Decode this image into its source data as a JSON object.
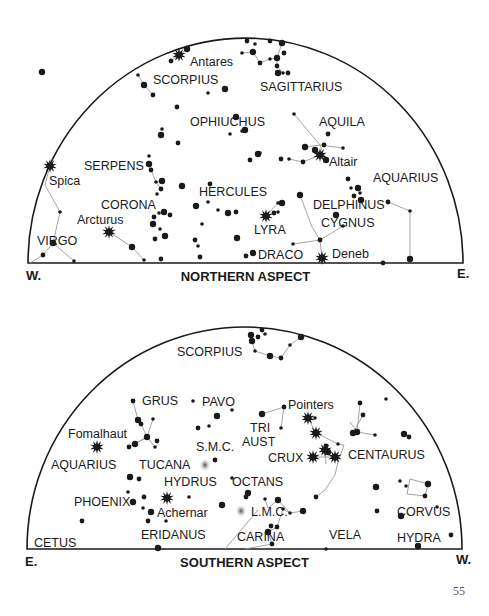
{
  "colors": {
    "ink": "#1a1a1a",
    "line": "#9a9a9a",
    "nebula": "#bdbdbd",
    "background": "#ffffff"
  },
  "page_number": "55",
  "northern": {
    "title": "NORTHERN ASPECT",
    "left_dir": "W.",
    "right_dir": "E.",
    "arc": {
      "x1": 28,
      "x2": 463,
      "base_y": 263,
      "top_y": 38
    },
    "labels": [
      {
        "text": "Antares",
        "x": 190,
        "y": 66
      },
      {
        "text": "SCORPIUS",
        "x": 153,
        "y": 84
      },
      {
        "text": "SAGITTARIUS",
        "x": 260,
        "y": 91
      },
      {
        "text": "OPHIUCHUS",
        "x": 190,
        "y": 126
      },
      {
        "text": "AQUILA",
        "x": 319,
        "y": 126
      },
      {
        "text": "Altair",
        "x": 329,
        "y": 166
      },
      {
        "text": "Spica",
        "x": 49,
        "y": 185
      },
      {
        "text": "SERPENS",
        "x": 84,
        "y": 170
      },
      {
        "text": "AQUARIUS",
        "x": 373,
        "y": 182
      },
      {
        "text": "HERCULES",
        "x": 199,
        "y": 196
      },
      {
        "text": "CORONA",
        "x": 101,
        "y": 209
      },
      {
        "text": "DELPHINUS",
        "x": 313,
        "y": 209
      },
      {
        "text": "Arcturus",
        "x": 77,
        "y": 224
      },
      {
        "text": "CYGNUS",
        "x": 321,
        "y": 227
      },
      {
        "text": "LYRA",
        "x": 254,
        "y": 234
      },
      {
        "text": "VIRGO",
        "x": 37,
        "y": 245
      },
      {
        "text": "DRACO",
        "x": 258,
        "y": 259
      },
      {
        "text": "Deneb",
        "x": 332,
        "y": 258
      }
    ],
    "bright_stars": [
      {
        "name": "Antares",
        "x": 179,
        "y": 55
      },
      {
        "name": "Altair",
        "x": 320,
        "y": 155
      },
      {
        "name": "Spica",
        "x": 50,
        "y": 166
      },
      {
        "name": "Arcturus",
        "x": 109,
        "y": 232
      },
      {
        "name": "Vega",
        "x": 266,
        "y": 216
      },
      {
        "name": "Deneb",
        "x": 322,
        "y": 258
      }
    ],
    "stars": [
      [
        187,
        49
      ],
      [
        171,
        61
      ],
      [
        138,
        75
      ],
      [
        144,
        85
      ],
      [
        153,
        95
      ],
      [
        208,
        93
      ],
      [
        225,
        89
      ],
      [
        177,
        107
      ],
      [
        162,
        129
      ],
      [
        161,
        135
      ],
      [
        178,
        143
      ],
      [
        230,
        134
      ],
      [
        245,
        130
      ],
      [
        247,
        41
      ],
      [
        255,
        44
      ],
      [
        282,
        43
      ],
      [
        284,
        53
      ],
      [
        242,
        53
      ],
      [
        253,
        52
      ],
      [
        260,
        63
      ],
      [
        270,
        59
      ],
      [
        277,
        58
      ],
      [
        277,
        66
      ],
      [
        283,
        73
      ],
      [
        278,
        73
      ],
      [
        288,
        73
      ],
      [
        294,
        114
      ],
      [
        305,
        147
      ],
      [
        324,
        145
      ],
      [
        343,
        148
      ],
      [
        326,
        160
      ],
      [
        303,
        162
      ],
      [
        289,
        159
      ],
      [
        315,
        150
      ],
      [
        328,
        134
      ],
      [
        242,
        131
      ],
      [
        236,
        117
      ],
      [
        250,
        160
      ],
      [
        260,
        153
      ],
      [
        258,
        154
      ],
      [
        281,
        159
      ],
      [
        149,
        156
      ],
      [
        149,
        164
      ],
      [
        151,
        170
      ],
      [
        156,
        182
      ],
      [
        162,
        181
      ],
      [
        161,
        189
      ],
      [
        157,
        194
      ],
      [
        182,
        186
      ],
      [
        210,
        184
      ],
      [
        208,
        202
      ],
      [
        228,
        213
      ],
      [
        236,
        212
      ],
      [
        218,
        210
      ],
      [
        196,
        206
      ],
      [
        195,
        240
      ],
      [
        202,
        224
      ],
      [
        237,
        238
      ],
      [
        200,
        257
      ],
      [
        198,
        246
      ],
      [
        153,
        224
      ],
      [
        154,
        217
      ],
      [
        159,
        213
      ],
      [
        164,
        212
      ],
      [
        170,
        215
      ],
      [
        160,
        229
      ],
      [
        165,
        236
      ],
      [
        155,
        239
      ],
      [
        144,
        260
      ],
      [
        132,
        247
      ],
      [
        161,
        259
      ],
      [
        278,
        203
      ],
      [
        282,
        203
      ],
      [
        274,
        213
      ],
      [
        278,
        212
      ],
      [
        300,
        195
      ],
      [
        348,
        179
      ],
      [
        351,
        188
      ],
      [
        358,
        188
      ],
      [
        354,
        196
      ],
      [
        360,
        193
      ],
      [
        361,
        200
      ],
      [
        388,
        202
      ],
      [
        410,
        211
      ],
      [
        410,
        259
      ],
      [
        383,
        263
      ],
      [
        343,
        226
      ],
      [
        336,
        215
      ],
      [
        320,
        240
      ],
      [
        293,
        244
      ],
      [
        253,
        253
      ],
      [
        246,
        256
      ],
      [
        60,
        212
      ],
      [
        53,
        243
      ],
      [
        43,
        255
      ],
      [
        74,
        261
      ],
      [
        42,
        72
      ],
      [
        270,
        41
      ]
    ],
    "lines": [
      [
        [
          138,
          75
        ],
        [
          144,
          85
        ],
        [
          153,
          95
        ]
      ],
      [
        [
          171,
          61
        ],
        [
          179,
          55
        ],
        [
          187,
          49
        ]
      ],
      [
        [
          242,
          53
        ],
        [
          253,
          52
        ],
        [
          260,
          63
        ],
        [
          270,
          59
        ],
        [
          277,
          58
        ],
        [
          282,
          43
        ]
      ],
      [
        [
          277,
          66
        ],
        [
          283,
          73
        ]
      ],
      [
        [
          277,
          58
        ],
        [
          277,
          66
        ]
      ],
      [
        [
          294,
          114
        ],
        [
          320,
          145
        ],
        [
          305,
          147
        ]
      ],
      [
        [
          320,
          145
        ],
        [
          343,
          148
        ]
      ],
      [
        [
          320,
          145
        ],
        [
          326,
          160
        ]
      ],
      [
        [
          326,
          160
        ],
        [
          320,
          155
        ],
        [
          303,
          162
        ],
        [
          289,
          159
        ]
      ],
      [
        [
          149,
          164
        ],
        [
          151,
          170
        ],
        [
          156,
          182
        ],
        [
          161,
          189
        ]
      ],
      [
        [
          156,
          182
        ],
        [
          162,
          181
        ]
      ],
      [
        [
          109,
          232
        ],
        [
          132,
          247
        ],
        [
          144,
          260
        ]
      ],
      [
        [
          50,
          166
        ],
        [
          45,
          185
        ],
        [
          60,
          212
        ],
        [
          53,
          243
        ],
        [
          43,
          255
        ]
      ],
      [
        [
          53,
          243
        ],
        [
          74,
          261
        ]
      ],
      [
        [
          43,
          255
        ],
        [
          30,
          263
        ]
      ],
      [
        [
          266,
          216
        ],
        [
          278,
          203
        ],
        [
          282,
          203
        ]
      ],
      [
        [
          266,
          216
        ],
        [
          274,
          213
        ]
      ],
      [
        [
          300,
          195
        ],
        [
          312,
          227
        ],
        [
          320,
          240
        ],
        [
          322,
          258
        ]
      ],
      [
        [
          293,
          244
        ],
        [
          320,
          240
        ],
        [
          343,
          226
        ]
      ],
      [
        [
          388,
          202
        ],
        [
          410,
          211
        ],
        [
          410,
          259
        ]
      ]
    ]
  },
  "southern": {
    "title": "SOUTHERN ASPECT",
    "left_dir": "E.",
    "right_dir": "W.",
    "arc": {
      "x1": 27,
      "x2": 462,
      "base_y": 549,
      "top_y": 327
    },
    "labels": [
      {
        "text": "SCORPIUS",
        "x": 177,
        "y": 356
      },
      {
        "text": "GRUS",
        "x": 142,
        "y": 405
      },
      {
        "text": "PAVO",
        "x": 202,
        "y": 406
      },
      {
        "text": "Pointers",
        "x": 288,
        "y": 409
      },
      {
        "text": "Fomalhaut",
        "x": 68,
        "y": 438
      },
      {
        "text": "TRI",
        "x": 250,
        "y": 432
      },
      {
        "text": "S.M.C.",
        "x": 196,
        "y": 451
      },
      {
        "text": "AUST",
        "x": 242,
        "y": 446
      },
      {
        "text": "CENTAURUS",
        "x": 348,
        "y": 459
      },
      {
        "text": "CRUX",
        "x": 268,
        "y": 462
      },
      {
        "text": "AQUARIUS",
        "x": 51,
        "y": 469
      },
      {
        "text": "TUCANA",
        "x": 139,
        "y": 469
      },
      {
        "text": "HYDRUS",
        "x": 164,
        "y": 486
      },
      {
        "text": "OCTANS",
        "x": 232,
        "y": 486
      },
      {
        "text": "PHOENIX",
        "x": 74,
        "y": 506
      },
      {
        "text": "Achernar",
        "x": 157,
        "y": 517
      },
      {
        "text": "L.M.C.",
        "x": 251,
        "y": 516
      },
      {
        "text": "CORVUS",
        "x": 397,
        "y": 516
      },
      {
        "text": "ERIDANUS",
        "x": 141,
        "y": 539
      },
      {
        "text": "CARINA",
        "x": 237,
        "y": 541
      },
      {
        "text": "VELA",
        "x": 329,
        "y": 539
      },
      {
        "text": "HYDRA",
        "x": 397,
        "y": 542
      },
      {
        "text": "CETUS",
        "x": 34,
        "y": 547
      }
    ],
    "bright_stars": [
      {
        "name": "Fomalhaut",
        "x": 97,
        "y": 447
      },
      {
        "name": "Pointer-1",
        "x": 308,
        "y": 418
      },
      {
        "name": "Pointer-2",
        "x": 316,
        "y": 433
      },
      {
        "name": "Crux-1",
        "x": 325,
        "y": 450
      },
      {
        "name": "Crux-2",
        "x": 313,
        "y": 457
      },
      {
        "name": "Crux-3",
        "x": 335,
        "y": 457
      },
      {
        "name": "Achernar",
        "x": 167,
        "y": 498
      }
    ],
    "nebulae": [
      {
        "name": "S.M.C.",
        "x": 205,
        "y": 465
      },
      {
        "name": "L.M.C.",
        "x": 241,
        "y": 511
      }
    ],
    "stars": [
      [
        251,
        335
      ],
      [
        262,
        330
      ],
      [
        265,
        334
      ],
      [
        252,
        341
      ],
      [
        258,
        337
      ],
      [
        255,
        351
      ],
      [
        270,
        356
      ],
      [
        281,
        358
      ],
      [
        290,
        345
      ],
      [
        301,
        337
      ],
      [
        133,
        401
      ],
      [
        193,
        401
      ],
      [
        138,
        420
      ],
      [
        141,
        424
      ],
      [
        153,
        419
      ],
      [
        147,
        437
      ],
      [
        157,
        441
      ],
      [
        155,
        447
      ],
      [
        135,
        444
      ],
      [
        129,
        447
      ],
      [
        232,
        410
      ],
      [
        217,
        416
      ],
      [
        198,
        428
      ],
      [
        209,
        426
      ],
      [
        262,
        414
      ],
      [
        284,
        407
      ],
      [
        281,
        428
      ],
      [
        328,
        452
      ],
      [
        326,
        446
      ],
      [
        338,
        444
      ],
      [
        353,
        433
      ],
      [
        363,
        415
      ],
      [
        375,
        435
      ],
      [
        357,
        432
      ],
      [
        360,
        403
      ],
      [
        386,
        399
      ],
      [
        404,
        434
      ],
      [
        409,
        437
      ],
      [
        406,
        486
      ],
      [
        401,
        516
      ],
      [
        316,
        497
      ],
      [
        315,
        418
      ],
      [
        130,
        477
      ],
      [
        139,
        479
      ],
      [
        128,
        492
      ],
      [
        133,
        502
      ],
      [
        144,
        497
      ],
      [
        143,
        508
      ],
      [
        151,
        512
      ],
      [
        148,
        521
      ],
      [
        166,
        521
      ],
      [
        222,
        505
      ],
      [
        215,
        460
      ],
      [
        232,
        478
      ],
      [
        248,
        493
      ],
      [
        246,
        497
      ],
      [
        265,
        499
      ],
      [
        278,
        500
      ],
      [
        271,
        526
      ],
      [
        290,
        513
      ],
      [
        303,
        511
      ],
      [
        277,
        527
      ],
      [
        283,
        509
      ],
      [
        268,
        532
      ],
      [
        272,
        544
      ],
      [
        326,
        549
      ],
      [
        158,
        548
      ],
      [
        82,
        521
      ],
      [
        189,
        497
      ],
      [
        376,
        487
      ],
      [
        377,
        511
      ],
      [
        400,
        481
      ],
      [
        428,
        484
      ],
      [
        425,
        496
      ],
      [
        437,
        507
      ],
      [
        418,
        546
      ],
      [
        451,
        535
      ]
    ],
    "lines": [
      [
        [
          252,
          341
        ],
        [
          255,
          351
        ],
        [
          270,
          356
        ],
        [
          281,
          358
        ],
        [
          290,
          345
        ],
        [
          301,
          337
        ]
      ],
      [
        [
          133,
          401
        ],
        [
          138,
          420
        ],
        [
          141,
          424
        ],
        [
          147,
          437
        ]
      ],
      [
        [
          153,
          419
        ],
        [
          147,
          437
        ]
      ],
      [
        [
          147,
          437
        ],
        [
          129,
          447
        ]
      ],
      [
        [
          147,
          437
        ],
        [
          135,
          444
        ]
      ],
      [
        [
          147,
          437
        ],
        [
          155,
          447
        ]
      ],
      [
        [
          262,
          414
        ],
        [
          284,
          407
        ],
        [
          281,
          428
        ]
      ],
      [
        [
          308,
          418
        ],
        [
          316,
          433
        ],
        [
          338,
          444
        ]
      ],
      [
        [
          353,
          433
        ],
        [
          363,
          415
        ]
      ],
      [
        [
          357,
          432
        ],
        [
          360,
          403
        ]
      ],
      [
        [
          357,
          432
        ],
        [
          375,
          435
        ]
      ],
      [
        [
          350,
          422
        ],
        [
          357,
          432
        ]
      ],
      [
        [
          338,
          444
        ],
        [
          344,
          445
        ],
        [
          338,
          462
        ],
        [
          335,
          475
        ],
        [
          325,
          490
        ],
        [
          316,
          497
        ]
      ],
      [
        [
          313,
          457
        ],
        [
          335,
          457
        ]
      ],
      [
        [
          325,
          450
        ],
        [
          326,
          464
        ]
      ],
      [
        [
          278,
          500
        ],
        [
          290,
          513
        ],
        [
          303,
          511
        ]
      ],
      [
        [
          290,
          513
        ],
        [
          283,
          509
        ],
        [
          277,
          527
        ],
        [
          268,
          532
        ],
        [
          272,
          544
        ]
      ],
      [
        [
          278,
          500
        ],
        [
          268,
          508
        ],
        [
          265,
          499
        ]
      ],
      [
        [
          272,
          544
        ],
        [
          245,
          549
        ]
      ],
      [
        [
          258,
          510
        ],
        [
          225,
          549
        ]
      ],
      [
        [
          410,
          479
        ],
        [
          428,
          484
        ],
        [
          425,
          496
        ],
        [
          407,
          494
        ],
        [
          410,
          479
        ]
      ]
    ]
  }
}
